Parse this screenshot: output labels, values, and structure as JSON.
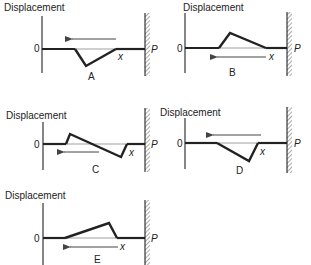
{
  "figure": {
    "axis_label": "Displacement",
    "zero_label": "0",
    "end_label": "P",
    "position_label": "x",
    "colors": {
      "ink": "#222222",
      "background": "#ffffff",
      "wall_hatch": "#555555"
    }
  },
  "panels": [
    {
      "id": "A",
      "label": "A",
      "pulse": "inverted triangle (trough)",
      "direction": "left"
    },
    {
      "id": "B",
      "label": "B",
      "pulse": "upright triangle, steep front (left), gentle tail",
      "direction": "left"
    },
    {
      "id": "C",
      "label": "C",
      "pulse": "upright peak at left, trough at right (inverted copy)",
      "direction": "left"
    },
    {
      "id": "D",
      "label": "D",
      "pulse": "inverted triangle, steep right edge",
      "direction": "left"
    },
    {
      "id": "E",
      "label": "E",
      "pulse": "upright triangle, gentle left, steep right edge",
      "direction": "left"
    }
  ]
}
